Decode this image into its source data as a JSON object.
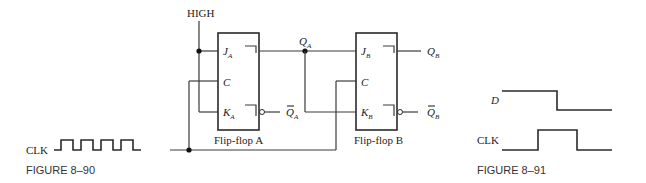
{
  "figure_8_90": {
    "caption": "FIGURE 8–90",
    "high_label": "HIGH",
    "clk_label": "CLK",
    "clk_pulses": 4,
    "flipflop_a": {
      "name": "Flip-flop A",
      "j_main": "J",
      "j_sub": "A",
      "c": "C",
      "k_main": "K",
      "k_sub": "A"
    },
    "flipflop_b": {
      "name": "Flip-flop B",
      "j_main": "J",
      "j_sub": "B",
      "c": "C",
      "k_main": "K",
      "k_sub": "B"
    },
    "q_a_main": "Q",
    "q_a_sub": "A",
    "qbar_a_main": "Q",
    "qbar_a_sub": "A",
    "q_b_main": "Q",
    "q_b_sub": "B",
    "qbar_b_main": "Q",
    "qbar_b_sub": "B"
  },
  "figure_8_91": {
    "caption": "FIGURE 8–91",
    "d_label": "D",
    "clk_label": "CLK",
    "d_levels": [
      "high",
      "low"
    ],
    "clk_levels": [
      "low",
      "high",
      "low"
    ]
  }
}
